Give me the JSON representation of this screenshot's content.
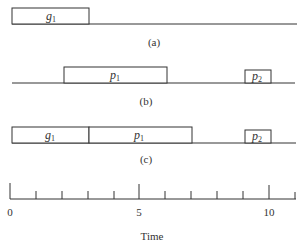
{
  "diagram": {
    "panels": [
      {
        "id": "a",
        "caption": "(a)",
        "blocks": [
          {
            "name": "g",
            "sub": "1",
            "start": 0,
            "end": 3
          }
        ]
      },
      {
        "id": "b",
        "caption": "(b)",
        "blocks": [
          {
            "name": "p",
            "sub": "1",
            "start": 2,
            "end": 6
          },
          {
            "name": "p",
            "sub": "2",
            "start": 9,
            "end": 10
          }
        ]
      },
      {
        "id": "c",
        "caption": "(c)",
        "blocks": [
          {
            "name": "g",
            "sub": "1",
            "start": 0,
            "end": 3
          },
          {
            "name": "p",
            "sub": "1",
            "start": 3,
            "end": 7
          },
          {
            "name": "p",
            "sub": "2",
            "start": 9,
            "end": 10
          }
        ]
      }
    ],
    "axis": {
      "label": "Time",
      "min": 0,
      "max": 11,
      "tick_labels": [
        "0",
        "5",
        "10"
      ],
      "major_ticks": [
        0,
        5,
        10
      ],
      "minor_ticks": [
        1,
        2,
        3,
        4,
        6,
        7,
        8,
        9,
        11
      ]
    }
  }
}
